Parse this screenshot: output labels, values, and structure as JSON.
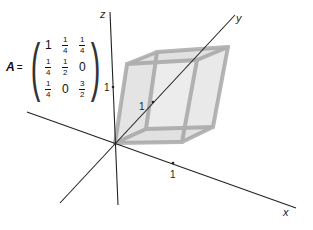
{
  "matrix": {
    "name": "A",
    "equals": "=",
    "rows": [
      [
        {
          "type": "int",
          "v": "1"
        },
        {
          "type": "frac",
          "n": "1",
          "d": "4"
        },
        {
          "type": "frac",
          "n": "1",
          "d": "4"
        }
      ],
      [
        {
          "type": "frac",
          "n": "1",
          "d": "4"
        },
        {
          "type": "frac",
          "n": "1",
          "d": "2"
        },
        {
          "type": "int",
          "v": "0"
        }
      ],
      [
        {
          "type": "frac",
          "n": "1",
          "d": "4"
        },
        {
          "type": "int",
          "v": "0"
        },
        {
          "type": "frac",
          "n": "3",
          "d": "2"
        }
      ]
    ]
  },
  "axes": {
    "x": {
      "label": "x",
      "tick_label": "1"
    },
    "y": {
      "label": "y",
      "tick_label": "1"
    },
    "z": {
      "label": "z",
      "tick_label": "1"
    }
  },
  "colors": {
    "axis": "#222222",
    "box_fill": "#d9d9d9",
    "box_edge": "#a8a8a8"
  }
}
